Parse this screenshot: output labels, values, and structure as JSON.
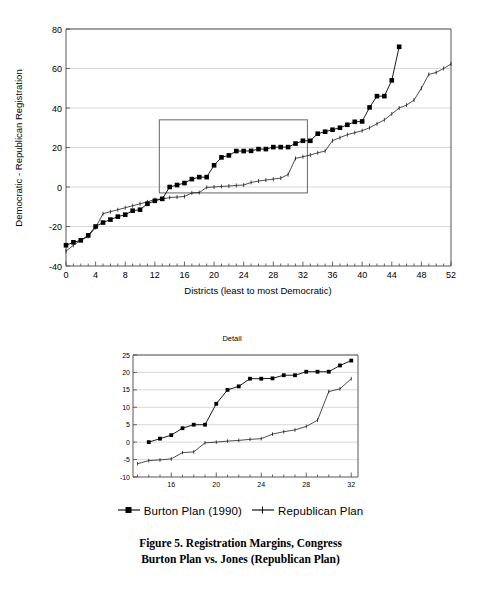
{
  "figure": {
    "caption_line1": "Figure 5. Registration Margins, Congress",
    "caption_line2": "Burton Plan vs. Jones (Republican Plan)"
  },
  "legend": {
    "items": [
      {
        "label": "Burton Plan (1990)",
        "marker": "square-line-marker",
        "color": "#000000"
      },
      {
        "label": "Republican Plan",
        "marker": "plain-line-marker",
        "color": "#000000"
      }
    ]
  },
  "chart_data": [
    {
      "id": "main",
      "type": "line",
      "title": "",
      "xlabel": "Districts (least to most Democratic)",
      "ylabel": "Democratic - Republican Registration",
      "xlim": [
        0,
        52
      ],
      "ylim": [
        -40,
        80
      ],
      "xticks": [
        0,
        4,
        8,
        12,
        16,
        20,
        24,
        28,
        32,
        36,
        40,
        44,
        48,
        52
      ],
      "yticks": [
        -40,
        -20,
        0,
        20,
        40,
        60,
        80
      ],
      "grid": "horizontal",
      "legend_position": "below",
      "inset_rect": {
        "x0": 12.6,
        "x1": 32.6,
        "y0": -3,
        "y1": 34
      },
      "series": [
        {
          "name": "Burton Plan (1990)",
          "marker": "filled-square",
          "x": [
            0,
            1,
            2,
            3,
            4,
            5,
            6,
            7,
            8,
            9,
            10,
            11,
            12,
            13,
            14,
            15,
            16,
            17,
            18,
            19,
            20,
            21,
            22,
            23,
            24,
            25,
            26,
            27,
            28,
            29,
            30,
            31,
            32,
            33,
            34,
            35,
            36,
            37,
            38,
            39,
            40,
            41,
            42,
            43,
            44,
            45
          ],
          "y": [
            -29.5,
            -28,
            -27,
            -24.5,
            -20,
            -18,
            -16.5,
            -15,
            -14,
            -12,
            -11.5,
            -8.5,
            -7,
            -6,
            0,
            1,
            2,
            4,
            5,
            5,
            11,
            15,
            16,
            18.2,
            18.2,
            18.3,
            19.2,
            19.2,
            20.2,
            20.2,
            20.2,
            22,
            23.4,
            23.4,
            27,
            28,
            29,
            30,
            31.5,
            33,
            33.2,
            40.3,
            46,
            46,
            54,
            71
          ]
        },
        {
          "name": "Republican Plan",
          "marker": "small-tick",
          "x": [
            0,
            1,
            2,
            3,
            4,
            5,
            6,
            7,
            8,
            9,
            10,
            11,
            12,
            13,
            14,
            15,
            16,
            17,
            18,
            19,
            20,
            21,
            22,
            23,
            24,
            25,
            26,
            27,
            28,
            29,
            30,
            31,
            32,
            33,
            34,
            35,
            36,
            37,
            38,
            39,
            40,
            41,
            42,
            43,
            44,
            45,
            46,
            47,
            48,
            49,
            50,
            51,
            52
          ],
          "y": [
            -32.5,
            -29.5,
            -27,
            -25,
            -20.5,
            -13.5,
            -12.5,
            -11.5,
            -10.5,
            -9.5,
            -8.5,
            -7.5,
            -6.3,
            -6.1,
            -5.3,
            -5.1,
            -4.8,
            -3,
            -2.8,
            -0.2,
            0,
            0.3,
            0.5,
            0.8,
            1,
            2.3,
            3,
            3.5,
            4,
            4.5,
            6.3,
            14.5,
            15.3,
            16.2,
            17.3,
            18.2,
            23.5,
            25,
            26.5,
            27.5,
            28.5,
            30,
            32,
            34,
            37,
            40,
            41.5,
            44,
            50,
            57,
            58,
            60,
            62.3
          ]
        }
      ]
    },
    {
      "id": "detail",
      "type": "line",
      "title": "Detail",
      "xlabel": "",
      "ylabel": "",
      "xlim": [
        12.6,
        32.6
      ],
      "ylim": [
        -10,
        25
      ],
      "xticks": [
        16,
        20,
        24,
        28,
        32
      ],
      "yticks": [
        -10,
        -5,
        0,
        5,
        10,
        15,
        20,
        25
      ],
      "grid": "horizontal",
      "series": [
        {
          "name": "Burton Plan (1990)",
          "marker": "filled-square",
          "x": [
            14,
            15,
            16,
            17,
            18,
            19,
            20,
            21,
            22,
            23,
            24,
            25,
            26,
            27,
            28,
            29,
            30,
            31,
            32
          ],
          "y": [
            0,
            1,
            2,
            4,
            5,
            5,
            11,
            15,
            16,
            18.2,
            18.2,
            18.3,
            19.2,
            19.2,
            20.2,
            20.2,
            20.2,
            22,
            23.4
          ]
        },
        {
          "name": "Republican Plan",
          "marker": "small-tick",
          "x": [
            13,
            14,
            15,
            16,
            17,
            18,
            19,
            20,
            21,
            22,
            23,
            24,
            25,
            26,
            27,
            28,
            29,
            30,
            31,
            32
          ],
          "y": [
            -6.2,
            -5.3,
            -5.1,
            -4.8,
            -3,
            -2.8,
            -0.2,
            0,
            0.3,
            0.5,
            0.8,
            1,
            2.3,
            3,
            3.5,
            4.5,
            6.3,
            14.5,
            15.3,
            18.2
          ]
        }
      ]
    }
  ]
}
